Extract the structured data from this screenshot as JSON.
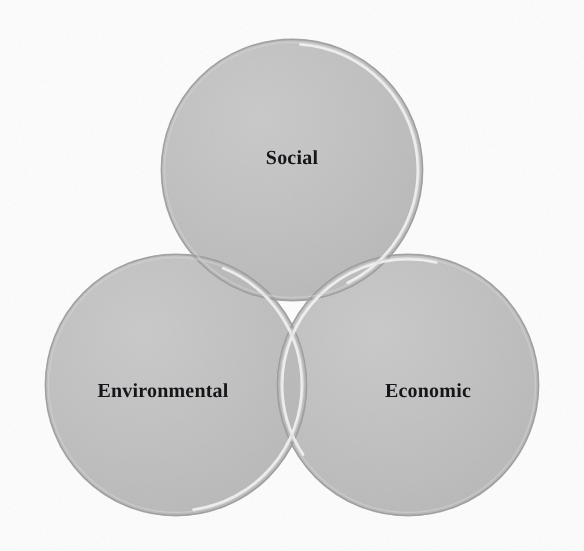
{
  "figure": {
    "type": "venn-diagram",
    "set_count": 3,
    "background_color": "#fdfdfd",
    "circle_fill_color": "#b9b9b9",
    "overlap_pair_color": "#8d8d8d",
    "overlap_triple_color": "#7c7c7c",
    "outline_color": "#9a9a9a",
    "highlight_color": "#f4f4f4",
    "label_color": "#16161a"
  },
  "circles": [
    {
      "id": "social",
      "label": "Social",
      "cx": 292,
      "cy": 170,
      "r": 131,
      "label_x": 292,
      "label_y": 158
    },
    {
      "id": "environmental",
      "label": "Environmental",
      "cx": 176,
      "cy": 385,
      "r": 131,
      "label_x": 163,
      "label_y": 391
    },
    {
      "id": "economic",
      "label": "Economic",
      "cx": 408,
      "cy": 385,
      "r": 131,
      "label_x": 428,
      "label_y": 391
    }
  ],
  "chart_data": {
    "type": "venn",
    "title": "",
    "sets": [
      "Social",
      "Environmental",
      "Economic"
    ],
    "set_labels": [
      "Social",
      "Environmental",
      "Economic"
    ],
    "regions": [
      {
        "sets": [
          "Social"
        ],
        "label": "Social",
        "shade": "light"
      },
      {
        "sets": [
          "Environmental"
        ],
        "label": "Environmental",
        "shade": "light"
      },
      {
        "sets": [
          "Economic"
        ],
        "label": "Economic",
        "shade": "light"
      },
      {
        "sets": [
          "Social",
          "Environmental"
        ],
        "label": "",
        "shade": "medium"
      },
      {
        "sets": [
          "Social",
          "Economic"
        ],
        "label": "",
        "shade": "medium"
      },
      {
        "sets": [
          "Environmental",
          "Economic"
        ],
        "label": "",
        "shade": "medium"
      },
      {
        "sets": [
          "Social",
          "Environmental",
          "Economic"
        ],
        "label": "",
        "shade": "dark"
      }
    ],
    "legend": "none",
    "grid": false
  }
}
